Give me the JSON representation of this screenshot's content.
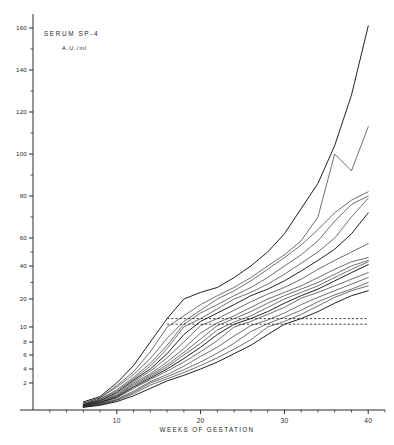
{
  "chart_data": {
    "type": "line",
    "title": "SERUM   SP-4",
    "subtitle": "A.U./ml",
    "xlabel": "WEEKS OF GESTATION",
    "ylabel": "",
    "grid": false,
    "legend": "none",
    "yscale": "piecewise-log",
    "xlim": [
      0,
      42
    ],
    "ylim": [
      0,
      165
    ],
    "xticks": [
      10,
      20,
      30,
      40
    ],
    "xtick_labels": [
      "10",
      "20",
      "30",
      "40"
    ],
    "xminor_ticks": [
      2,
      4,
      6,
      8,
      12,
      14,
      16,
      18,
      22,
      24,
      26,
      28,
      32,
      34,
      36,
      38,
      42
    ],
    "yticks": [
      2,
      4,
      6,
      8,
      10,
      20,
      40,
      60,
      80,
      100,
      120,
      140,
      160
    ],
    "ytick_labels": [
      "2",
      "4",
      "6",
      "8",
      "10",
      "20",
      "40",
      "60",
      "80",
      "100",
      "120",
      "140",
      "160"
    ],
    "reference_lines": [
      {
        "value": 13,
        "style": "dashed",
        "x_start": 16,
        "x_end": 40
      },
      {
        "value": 11,
        "style": "dashed",
        "x_start": 16,
        "x_end": 40
      }
    ],
    "series": [
      {
        "name": "subject-1",
        "x": [
          6,
          8,
          10,
          12,
          14,
          16,
          18,
          20,
          22,
          24,
          26,
          28,
          30,
          32,
          34,
          36,
          38,
          40
        ],
        "values": [
          0.6,
          1.0,
          2.0,
          4.5,
          8.0,
          13.0,
          20.0,
          24.0,
          27.0,
          33.0,
          40.0,
          50.0,
          62.0,
          74.0,
          86.0,
          104.0,
          128.0,
          161.0
        ]
      },
      {
        "name": "subject-2",
        "x": [
          6,
          8,
          10,
          12,
          14,
          16,
          18,
          20,
          22,
          24,
          26,
          28,
          30,
          32,
          34,
          36,
          38,
          40
        ],
        "values": [
          0.5,
          0.9,
          1.8,
          3.6,
          6.5,
          10.0,
          14.0,
          18.0,
          22.0,
          27.0,
          33.0,
          40.0,
          48.0,
          58.0,
          70.0,
          100.0,
          92.0,
          113.0
        ]
      },
      {
        "name": "subject-3",
        "x": [
          6,
          8,
          10,
          12,
          14,
          16,
          18,
          20,
          22,
          24,
          26,
          28,
          30,
          32,
          34,
          36,
          38,
          40
        ],
        "values": [
          0.5,
          0.9,
          1.7,
          3.2,
          5.5,
          8.5,
          12.0,
          16.0,
          20.0,
          25.0,
          31.0,
          38.0,
          46.0,
          55.0,
          64.0,
          72.0,
          78.0,
          82.0
        ]
      },
      {
        "name": "subject-4",
        "x": [
          6,
          8,
          10,
          12,
          14,
          16,
          18,
          20,
          22,
          24,
          26,
          28,
          30,
          32,
          34,
          36,
          38,
          40
        ],
        "values": [
          0.4,
          0.8,
          1.5,
          2.8,
          4.8,
          7.5,
          11.0,
          15.0,
          18.0,
          22.0,
          27.0,
          33.0,
          40.0,
          48.0,
          58.0,
          68.0,
          76.0,
          80.0
        ]
      },
      {
        "name": "subject-5",
        "x": [
          6,
          8,
          10,
          12,
          14,
          16,
          18,
          20,
          22,
          24,
          26,
          28,
          30,
          32,
          34,
          36,
          38,
          40
        ],
        "values": [
          0.4,
          0.8,
          1.4,
          2.6,
          4.4,
          7.0,
          10.0,
          13.0,
          16.5,
          20.0,
          24.0,
          29.0,
          35.0,
          42.0,
          50.0,
          60.0,
          70.0,
          79.0
        ]
      },
      {
        "name": "subject-6",
        "x": [
          6,
          8,
          10,
          12,
          14,
          16,
          18,
          20,
          22,
          24,
          26,
          28,
          30,
          32,
          34,
          36,
          38,
          40
        ],
        "values": [
          0.4,
          0.7,
          1.3,
          2.4,
          4.0,
          6.2,
          9.0,
          12.0,
          15.0,
          18.0,
          22.0,
          26.0,
          31.0,
          37.0,
          44.0,
          52.0,
          62.0,
          72.0
        ]
      },
      {
        "name": "subject-7",
        "x": [
          6,
          8,
          10,
          12,
          14,
          16,
          18,
          20,
          22,
          24,
          26,
          28,
          30,
          32,
          34,
          36,
          38,
          40
        ],
        "values": [
          0.35,
          0.7,
          1.2,
          2.2,
          3.7,
          5.6,
          8.0,
          10.5,
          13.0,
          16.0,
          19.0,
          23.0,
          27.0,
          32.0,
          38.0,
          44.0,
          50.0,
          56.0
        ]
      },
      {
        "name": "subject-8",
        "x": [
          6,
          8,
          10,
          12,
          14,
          16,
          18,
          20,
          22,
          24,
          26,
          28,
          30,
          32,
          34,
          36,
          38,
          40
        ],
        "values": [
          0.35,
          0.65,
          1.1,
          2.0,
          3.3,
          5.0,
          7.0,
          9.2,
          11.5,
          14.0,
          17.0,
          20.0,
          24.0,
          28.0,
          33.0,
          38.0,
          43.0,
          46.0
        ]
      },
      {
        "name": "subject-9",
        "x": [
          6,
          8,
          10,
          12,
          14,
          16,
          18,
          20,
          22,
          24,
          26,
          28,
          30,
          32,
          34,
          36,
          38,
          40
        ],
        "values": [
          0.3,
          0.6,
          1.05,
          1.9,
          3.1,
          4.6,
          6.4,
          8.4,
          10.5,
          13.0,
          15.5,
          18.5,
          22.0,
          26.0,
          30.0,
          35.0,
          40.0,
          44.0
        ]
      },
      {
        "name": "subject-10",
        "x": [
          6,
          8,
          10,
          12,
          14,
          16,
          18,
          20,
          22,
          24,
          26,
          28,
          30,
          32,
          34,
          36,
          38,
          40
        ],
        "values": [
          0.3,
          0.55,
          1.0,
          1.8,
          2.9,
          4.3,
          6.0,
          7.8,
          9.6,
          11.8,
          14.0,
          17.0,
          20.0,
          24.0,
          28.0,
          33.0,
          38.0,
          43.0
        ]
      },
      {
        "name": "subject-11",
        "x": [
          6,
          8,
          10,
          12,
          14,
          16,
          18,
          20,
          22,
          24,
          26,
          28,
          30,
          32,
          34,
          36,
          38,
          40
        ],
        "values": [
          0.3,
          0.55,
          0.95,
          1.7,
          2.7,
          4.0,
          5.5,
          7.2,
          9.0,
          11.0,
          13.0,
          15.5,
          18.5,
          22.0,
          26.0,
          31.0,
          36.0,
          41.0
        ]
      },
      {
        "name": "subject-12",
        "x": [
          6,
          8,
          10,
          12,
          14,
          16,
          18,
          20,
          22,
          24,
          26,
          28,
          30,
          32,
          34,
          36,
          38,
          40
        ],
        "values": [
          0.28,
          0.5,
          0.9,
          1.6,
          2.5,
          3.7,
          5.0,
          6.5,
          8.2,
          10.0,
          12.0,
          14.5,
          17.0,
          20.5,
          24.0,
          28.0,
          32.0,
          36.0
        ]
      },
      {
        "name": "subject-13",
        "x": [
          6,
          8,
          10,
          12,
          14,
          16,
          18,
          20,
          22,
          24,
          26,
          28,
          30,
          32,
          34,
          36,
          38,
          40
        ],
        "values": [
          0.25,
          0.45,
          0.8,
          1.4,
          2.2,
          3.2,
          4.4,
          5.8,
          7.2,
          8.8,
          10.5,
          12.5,
          15.0,
          18.0,
          21.0,
          25.0,
          29.0,
          33.0
        ]
      },
      {
        "name": "subject-14",
        "x": [
          6,
          8,
          10,
          12,
          14,
          16,
          18,
          20,
          22,
          24,
          26,
          28,
          30,
          32,
          34,
          36,
          38,
          40
        ],
        "values": [
          0.25,
          0.42,
          0.75,
          1.3,
          2.0,
          2.9,
          3.9,
          5.0,
          6.3,
          7.8,
          9.4,
          11.2,
          13.5,
          16.0,
          19.0,
          22.5,
          26.0,
          30.0
        ]
      },
      {
        "name": "subject-15",
        "x": [
          6,
          8,
          10,
          12,
          14,
          16,
          18,
          20,
          22,
          24,
          26,
          28,
          30,
          32,
          34,
          36,
          38,
          40
        ],
        "values": [
          0.22,
          0.4,
          0.7,
          1.2,
          1.85,
          2.6,
          3.5,
          4.5,
          5.6,
          6.9,
          8.3,
          10.0,
          12.0,
          14.5,
          17.5,
          21.0,
          25.0,
          28.0
        ]
      },
      {
        "name": "subject-16",
        "x": [
          6,
          8,
          10,
          12,
          14,
          16,
          18,
          20,
          22,
          24,
          26,
          28,
          30,
          32,
          34,
          36,
          38,
          40
        ],
        "values": [
          0.2,
          0.35,
          0.62,
          1.05,
          1.6,
          2.3,
          3.1,
          4.0,
          5.0,
          6.2,
          7.5,
          9.0,
          11.0,
          13.0,
          15.5,
          18.5,
          22.0,
          25.0
        ]
      }
    ]
  },
  "annotations": {
    "main": "SERUM   SP-4",
    "sub": "A.U./ml"
  }
}
